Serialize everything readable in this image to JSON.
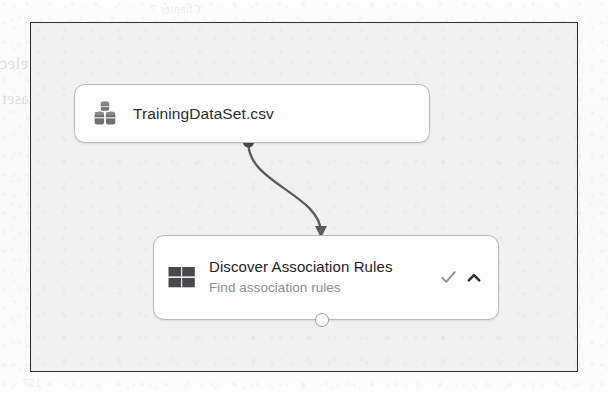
{
  "page": {
    "background_color": "#fbfbfb",
    "ghost_text": {
      "header": "Chapter 7",
      "line_top": "e Discover Association Rules and Select",
      "line_bottom": "ns in Dataset",
      "footer": "157"
    }
  },
  "canvas": {
    "name": "experiment-designer-canvas",
    "background_color": "#f1f1f1",
    "border_color": "#2e2e30"
  },
  "nodes": [
    {
      "id": "dataset-node",
      "title": "TrainingDataSet.csv",
      "icon": "database-icon",
      "icon_color": "#6f6f71",
      "border_color": "#b9b9b9",
      "background_color": "#fdfdfd",
      "output_port": "filled-dot"
    },
    {
      "id": "module-node",
      "title": "Discover Association Rules",
      "subtitle": "Find association rules",
      "icon": "grid-module-icon",
      "icon_color": "#4a4a4c",
      "border_color": "#b9b9b9",
      "background_color": "#fdfdfd",
      "status_icon": "check-icon",
      "status_color": "#8e8e90",
      "collapse_icon": "chevron-up-icon",
      "collapse_color": "#2e2e30",
      "input_port": "arrowhead",
      "output_port": "hollow-circle"
    }
  ],
  "connector": {
    "name": "dataset-to-module-connector",
    "from": "dataset-node-output",
    "to": "module-node-input",
    "style": "s-curve",
    "color": "#5c5c5e",
    "arrowhead": true
  }
}
